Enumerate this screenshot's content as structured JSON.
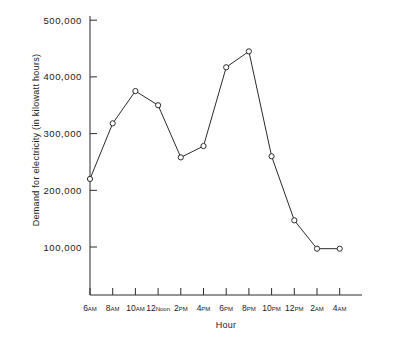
{
  "chart_data": {
    "type": "line",
    "title": "",
    "xlabel": "Hour",
    "ylabel": "Demand for electricity (in kilowatt hours)",
    "categories": [
      "6AM",
      "8AM",
      "10AM",
      "12Noon",
      "2PM",
      "4PM",
      "6PM",
      "8PM",
      "10PM",
      "12PM",
      "2AM",
      "4AM"
    ],
    "category_parts": [
      {
        "big": "6",
        "small": "AM"
      },
      {
        "big": "8",
        "small": "AM"
      },
      {
        "big": "10",
        "small": "AM"
      },
      {
        "big": "12",
        "small": "Noon"
      },
      {
        "big": "2",
        "small": "PM"
      },
      {
        "big": "4",
        "small": "PM"
      },
      {
        "big": "6",
        "small": "PM"
      },
      {
        "big": "8",
        "small": "PM"
      },
      {
        "big": "10",
        "small": "PM"
      },
      {
        "big": "12",
        "small": "PM"
      },
      {
        "big": "2",
        "small": "AM"
      },
      {
        "big": "4",
        "small": "AM"
      }
    ],
    "values": [
      220000,
      318000,
      375000,
      350000,
      258000,
      278000,
      417000,
      445000,
      260000,
      147000,
      97000,
      97000
    ],
    "ylim": [
      0,
      500000
    ],
    "ytick_values": [
      100000,
      200000,
      300000,
      400000,
      500000
    ],
    "ytick_labels": [
      "100,000",
      "200,000",
      "300,000",
      "400,000",
      "500,000"
    ],
    "grid": false,
    "legend": "none",
    "marker": "open-circle",
    "line_color": "#2b2b2b",
    "marker_fill": "#ffffff",
    "background_color": "#ffffff"
  },
  "axis": {
    "y_title": "Demand for electricity (in kilowatt hours)",
    "x_title": "Hour"
  }
}
